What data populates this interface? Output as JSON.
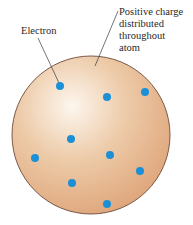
{
  "diagram": {
    "labels": {
      "electron": "Electron",
      "positive_charge": [
        "Positive charge",
        "distributed",
        "throughout",
        "atom"
      ]
    },
    "sphere": {
      "cx": 91,
      "cy": 135,
      "r": 79,
      "fill_light": "#fbf0e4",
      "fill_mid": "#ecc7a3",
      "fill_dark": "#dfa67a",
      "stroke": "#7a5a48"
    },
    "electron_color": "#1b90d6",
    "electrons": [
      {
        "x": 60,
        "y": 86
      },
      {
        "x": 107,
        "y": 97
      },
      {
        "x": 145,
        "y": 92
      },
      {
        "x": 71,
        "y": 139
      },
      {
        "x": 35,
        "y": 158
      },
      {
        "x": 110,
        "y": 155
      },
      {
        "x": 140,
        "y": 171
      },
      {
        "x": 72,
        "y": 183
      },
      {
        "x": 107,
        "y": 204
      }
    ]
  }
}
